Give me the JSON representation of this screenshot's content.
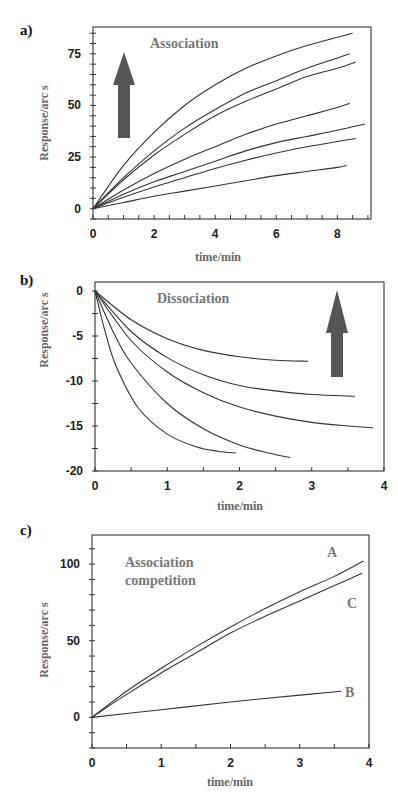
{
  "chart_data": [
    {
      "id": "a",
      "panel_label": "a)",
      "type": "line",
      "title": "Association",
      "xlabel": "time/min",
      "ylabel": "Response/arc s",
      "xlim": [
        0,
        9.1
      ],
      "ylim": [
        -5,
        88
      ],
      "xticks": [
        0,
        2,
        4,
        6,
        8
      ],
      "yticks": [
        0,
        25,
        50,
        75
      ],
      "grid": false,
      "annotations": [
        "upward arrow (increasing concentration)"
      ],
      "series": [
        {
          "name": "curve1",
          "x": [
            0,
            1,
            2,
            3,
            4,
            5,
            6,
            7,
            8,
            8.5
          ],
          "y": [
            0,
            21,
            37,
            50,
            60,
            68,
            74,
            79,
            83,
            85
          ]
        },
        {
          "name": "curve2",
          "x": [
            0,
            1,
            2,
            3,
            4,
            5,
            6,
            7,
            8,
            8.4
          ],
          "y": [
            0,
            15,
            28,
            39,
            48,
            56,
            62,
            68,
            73,
            75
          ]
        },
        {
          "name": "curve3",
          "x": [
            0,
            1,
            2,
            3,
            4,
            5,
            6,
            7,
            8,
            8.6
          ],
          "y": [
            0,
            14,
            26,
            36,
            45,
            52,
            58,
            64,
            68,
            71
          ]
        },
        {
          "name": "curve4",
          "x": [
            0,
            1,
            2,
            3,
            4,
            5,
            6,
            7,
            8,
            8.4
          ],
          "y": [
            0,
            9,
            17,
            24,
            30,
            36,
            41,
            45,
            49,
            51
          ]
        },
        {
          "name": "curve5",
          "x": [
            0,
            1,
            2,
            3,
            4,
            5,
            6,
            7,
            8,
            8.9
          ],
          "y": [
            0,
            7,
            13,
            18,
            23,
            28,
            32,
            35,
            38,
            41
          ]
        },
        {
          "name": "curve6",
          "x": [
            0,
            1,
            2,
            3,
            4,
            5,
            6,
            7,
            8,
            8.6
          ],
          "y": [
            0,
            5.5,
            10.5,
            15,
            19.5,
            23.5,
            27,
            30,
            32.5,
            34
          ]
        },
        {
          "name": "curve7",
          "x": [
            0,
            1,
            2,
            3,
            4,
            5,
            6,
            7,
            8,
            8.3
          ],
          "y": [
            0,
            3,
            6,
            8.5,
            11,
            13.5,
            16,
            18,
            20,
            21
          ]
        }
      ]
    },
    {
      "id": "b",
      "panel_label": "b)",
      "type": "line",
      "title": "Dissociation",
      "xlabel": "time/min",
      "ylabel": "Response/arc s",
      "xlim": [
        0,
        4
      ],
      "ylim": [
        -20,
        1
      ],
      "xticks": [
        0,
        1,
        2,
        3,
        4
      ],
      "yticks": [
        0,
        -5,
        -10,
        -15,
        -20
      ],
      "grid": false,
      "annotations": [
        "upward arrow (increasing concentration)"
      ],
      "series": [
        {
          "name": "curve1",
          "x": [
            0,
            0.5,
            1,
            1.5,
            2,
            2.5,
            2.95
          ],
          "y": [
            0,
            -3.2,
            -5.3,
            -6.6,
            -7.3,
            -7.7,
            -7.8
          ]
        },
        {
          "name": "curve2",
          "x": [
            0,
            0.5,
            1,
            1.5,
            2,
            2.5,
            3,
            3.6
          ],
          "y": [
            0,
            -4.5,
            -7.4,
            -9.3,
            -10.5,
            -11.1,
            -11.5,
            -11.7
          ]
        },
        {
          "name": "curve3",
          "x": [
            0,
            0.5,
            1,
            1.5,
            2,
            2.5,
            3,
            3.5,
            3.85
          ],
          "y": [
            0,
            -5.5,
            -9,
            -11.3,
            -12.9,
            -13.9,
            -14.6,
            -15.0,
            -15.2
          ]
        },
        {
          "name": "curve4",
          "x": [
            0,
            0.25,
            0.5,
            1,
            1.5,
            2,
            2.4,
            2.7
          ],
          "y": [
            0,
            -4.5,
            -8,
            -12.5,
            -15.3,
            -17.1,
            -18.0,
            -18.5
          ]
        },
        {
          "name": "curve5",
          "x": [
            0,
            0.15,
            0.3,
            0.6,
            1,
            1.4,
            1.7,
            1.95
          ],
          "y": [
            0,
            -4.8,
            -8.5,
            -13,
            -15.9,
            -17.3,
            -17.8,
            -18.0
          ]
        }
      ]
    },
    {
      "id": "c",
      "panel_label": "c)",
      "type": "line",
      "title": "Association competition",
      "xlabel": "time/min",
      "ylabel": "Response/arc s",
      "xlim": [
        0,
        4
      ],
      "ylim": [
        -20,
        119
      ],
      "xticks": [
        0,
        1,
        2,
        3,
        4
      ],
      "yticks": [
        0,
        50,
        100
      ],
      "grid": false,
      "annotations": [],
      "series": [
        {
          "name": "A",
          "x": [
            0,
            0.5,
            1,
            1.5,
            2,
            2.5,
            3,
            3.5,
            3.92
          ],
          "y": [
            0,
            17,
            32,
            46,
            59,
            71,
            82,
            92,
            102
          ]
        },
        {
          "name": "C",
          "x": [
            0,
            0.5,
            1,
            1.5,
            2,
            2.5,
            3,
            3.5,
            3.9
          ],
          "y": [
            0,
            15,
            29,
            42,
            55,
            66,
            76,
            86,
            94
          ]
        },
        {
          "name": "B",
          "x": [
            0,
            1,
            2,
            3,
            3.6
          ],
          "y": [
            0,
            5,
            10,
            14.5,
            17
          ]
        }
      ]
    }
  ],
  "panels": {
    "a": {
      "label": "a)",
      "title": "Association",
      "xlabel": "time/min",
      "ylabel": "Response/arc s"
    },
    "b": {
      "label": "b)",
      "title": "Dissociation",
      "xlabel": "time/min",
      "ylabel": "Response/arc s"
    },
    "c": {
      "label": "c)",
      "title_line1": "Association",
      "title_line2": "competition",
      "xlabel": "time/min",
      "ylabel": "Response/arc s",
      "series_labels": {
        "A": "A",
        "B": "B",
        "C": "C"
      }
    }
  },
  "colors": {
    "line": "#333333",
    "arrow": "#555555",
    "annotation": "#777777"
  }
}
